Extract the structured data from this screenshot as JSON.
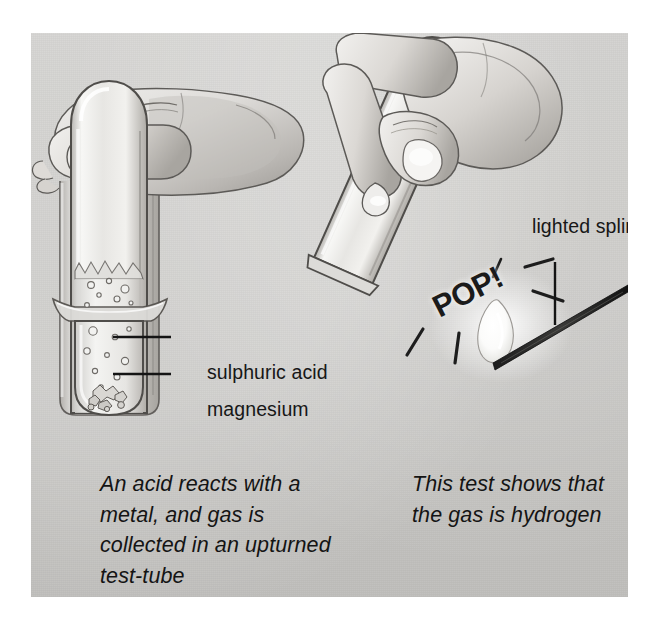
{
  "figure": {
    "background_color": "#c9c8c5",
    "ink_color": "#171717"
  },
  "labels": {
    "sulphuric_acid": "sulphuric acid",
    "magnesium": "magnesium",
    "lighted_splint": "lighted splint",
    "pop": "POP!"
  },
  "captions": {
    "left": "An acid reacts with a metal, and gas is collected in an upturned test-tube",
    "right": "This test shows that the gas is hydrogen"
  },
  "panels": {
    "left": {
      "name": "collecting-gas-panel",
      "elements": [
        "hand",
        "upturned-test-tube",
        "beaker",
        "sulphuric-acid",
        "magnesium",
        "gas-bubbles"
      ]
    },
    "right": {
      "name": "pop-test-panel",
      "elements": [
        "hand",
        "tilted-test-tube",
        "lighted-splint",
        "flame",
        "pop-burst"
      ]
    }
  }
}
